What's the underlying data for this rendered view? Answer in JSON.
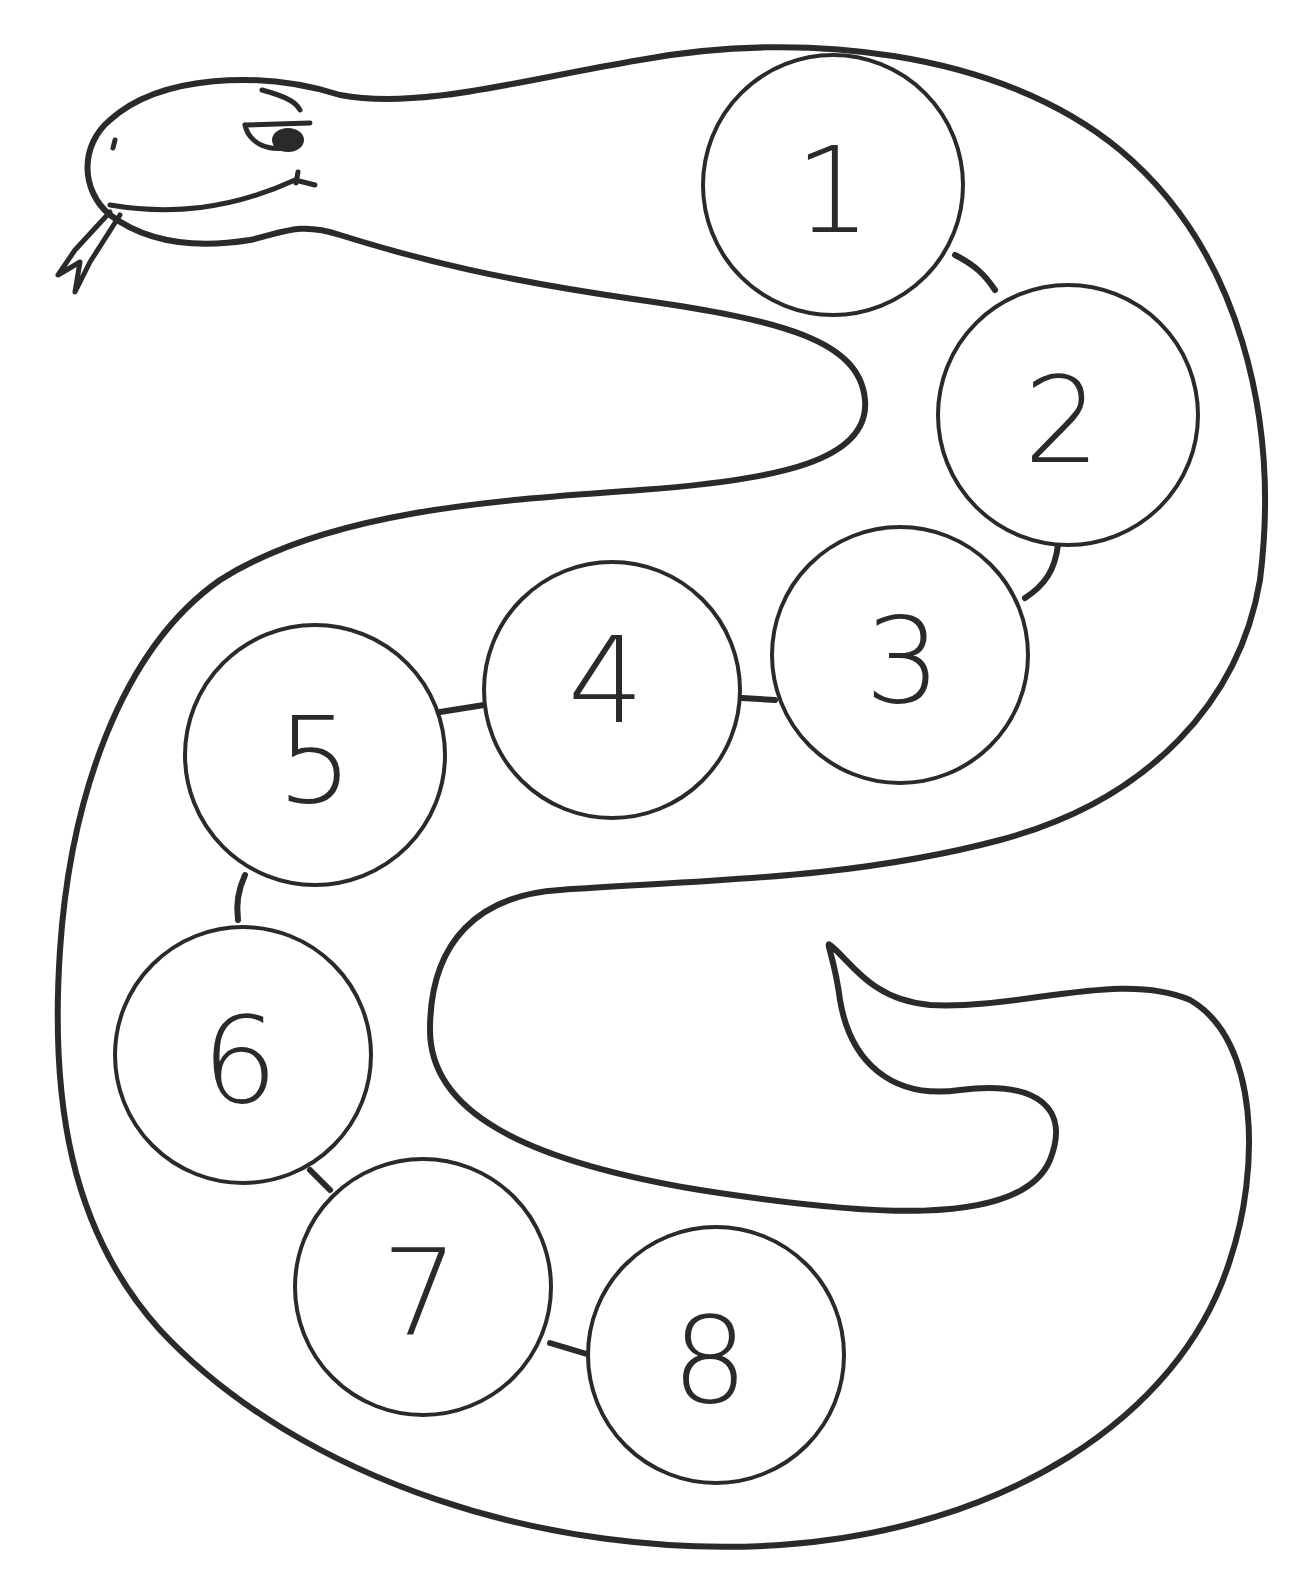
{
  "page": {
    "type": "coloring-sheet"
  },
  "colors": {
    "line": "#2a2a2a",
    "background": "#ffffff"
  },
  "circles": [
    {
      "label": "1",
      "cx": 833,
      "cy": 185,
      "r": 130
    },
    {
      "label": "2",
      "cx": 1068,
      "cy": 415,
      "r": 130
    },
    {
      "label": "3",
      "cx": 900,
      "cy": 655,
      "r": 128
    },
    {
      "label": "4",
      "cx": 612,
      "cy": 690,
      "r": 128
    },
    {
      "label": "5",
      "cx": 315,
      "cy": 755,
      "r": 130
    },
    {
      "label": "6",
      "cx": 243,
      "cy": 1055,
      "r": 128
    },
    {
      "label": "7",
      "cx": 423,
      "cy": 1287,
      "r": 128
    },
    {
      "label": "8",
      "cx": 716,
      "cy": 1355,
      "r": 128
    }
  ]
}
